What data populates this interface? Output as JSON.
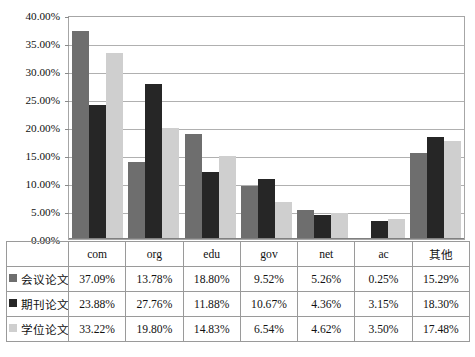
{
  "chart_data": {
    "type": "bar",
    "title": "",
    "xlabel": "",
    "ylabel": "",
    "ylim": [
      0,
      40
    ],
    "ytick_labels": [
      "40.00%",
      "35.00%",
      "30.00%",
      "25.00%",
      "20.00%",
      "15.00%",
      "10.00%",
      "5.00%",
      "0.00%"
    ],
    "ytick_values": [
      40,
      35,
      30,
      25,
      20,
      15,
      10,
      5,
      0
    ],
    "grid": true,
    "legend_position": "table-left",
    "categories": [
      "com",
      "org",
      "edu",
      "gov",
      "net",
      "ac",
      "其他"
    ],
    "series": [
      {
        "name": "会议论文",
        "color": "#6e6e6e",
        "values": [
          37.09,
          13.78,
          18.8,
          9.52,
          5.26,
          0.25,
          15.29
        ],
        "labels": [
          "37.09%",
          "13.78%",
          "18.80%",
          "9.52%",
          "5.26%",
          "0.25%",
          "15.29%"
        ]
      },
      {
        "name": "期刊论文",
        "color": "#262626",
        "values": [
          23.88,
          27.76,
          11.88,
          10.67,
          4.36,
          3.15,
          18.3
        ],
        "labels": [
          "23.88%",
          "27.76%",
          "11.88%",
          "10.67%",
          "4.36%",
          "3.15%",
          "18.30%"
        ]
      },
      {
        "name": "学位论文",
        "color": "#cfcfcf",
        "values": [
          33.22,
          19.8,
          14.83,
          6.54,
          4.62,
          3.5,
          17.48
        ],
        "labels": [
          "33.22%",
          "19.80%",
          "14.83%",
          "6.54%",
          "4.62%",
          "3.50%",
          "17.48%"
        ]
      }
    ]
  }
}
